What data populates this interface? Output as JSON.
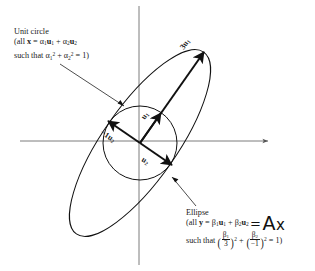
{
  "figure": {
    "type": "math-diagram",
    "axes": {
      "horizontal": {
        "y": 141,
        "x_start": 20,
        "x_end": 270,
        "arrow": "right"
      },
      "vertical": {
        "x": 139,
        "y_start": 5,
        "y_end": 265,
        "arrow": "none"
      }
    },
    "origin": {
      "x": 140,
      "y": 143
    },
    "circle": {
      "radius": 37,
      "label": "unit circle"
    },
    "ellipse": {
      "semi_major": 111,
      "semi_minor": 37,
      "rotation_deg": -55
    }
  },
  "unit_circle_caption": {
    "title": "Unit circle",
    "line2_prefix": "(all ",
    "line2_x": "x",
    "line2_eq": " = ",
    "line2_a1": "α",
    "line2_sub1": "1",
    "line2_u1": "u",
    "line2_u1sub": "1",
    "line2_plus": " + ",
    "line2_a2": "α",
    "line2_sub2": "2",
    "line2_u2": "u",
    "line2_u2sub": "2",
    "line3_prefix": "such that ",
    "line3_a1": "α",
    "line3_a1sub": "1",
    "line3_a1sup": "2",
    "line3_plus": " + ",
    "line3_a2": "α",
    "line3_a2sub": "2",
    "line3_a2sup": "2",
    "line3_tail": " = 1)"
  },
  "ellipse_caption": {
    "title": "Ellipse",
    "line2_prefix": "(all ",
    "line2_y": "y",
    "line2_eq": " = ",
    "line2_b1": "β",
    "line2_b1sub": "1",
    "line2_u1": "u",
    "line2_u1sub": "1",
    "line2_plus": " + ",
    "line2_b2": "β",
    "line2_b2sub": "2",
    "line2_u2": "u",
    "line2_u2sub": "2",
    "line3_prefix": "such that ",
    "frac1_num_sym": "β",
    "frac1_num_sub": "1",
    "frac1_den": "3",
    "frac1_exp": "2",
    "line3_plus": " + ",
    "frac2_num_sym": "β",
    "frac2_num_sub": "2",
    "frac2_den": "−1",
    "frac2_exp": "2",
    "line3_tail": " = 1)"
  },
  "ax_annotation": {
    "equals": "=",
    "matrix": "A",
    "vector": "x"
  },
  "arrow_labels": {
    "three_u1": {
      "text": "3u",
      "sub": "1"
    },
    "u1": {
      "text": "u",
      "sub": "1"
    },
    "neg_u2": {
      "text": "−1u",
      "sub": "2"
    },
    "u2": {
      "text": "u",
      "sub": "2"
    }
  }
}
